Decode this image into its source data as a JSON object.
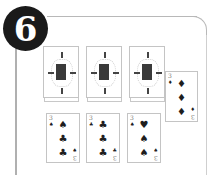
{
  "badge": {
    "label": "6"
  },
  "tableau": {
    "face_down_stacks": [
      {
        "id": 1,
        "state": "face-down"
      },
      {
        "id": 2,
        "state": "face-down"
      },
      {
        "id": 3,
        "state": "face-down"
      }
    ],
    "face_up_top": {
      "rank": "3",
      "pips": [
        "♦",
        "♦",
        "♦"
      ],
      "corner_pip": "♦"
    },
    "face_up_row": [
      {
        "rank": "3",
        "pips": [
          "♠",
          "♣",
          "♣"
        ],
        "corner_pip": "♠"
      },
      {
        "rank": "3",
        "pips": [
          "♣",
          "♣",
          "♣"
        ],
        "corner_pip": "♣"
      },
      {
        "rank": "3",
        "pips": [
          "♥",
          "♠",
          "♠"
        ],
        "corner_pip": "♠"
      }
    ]
  }
}
